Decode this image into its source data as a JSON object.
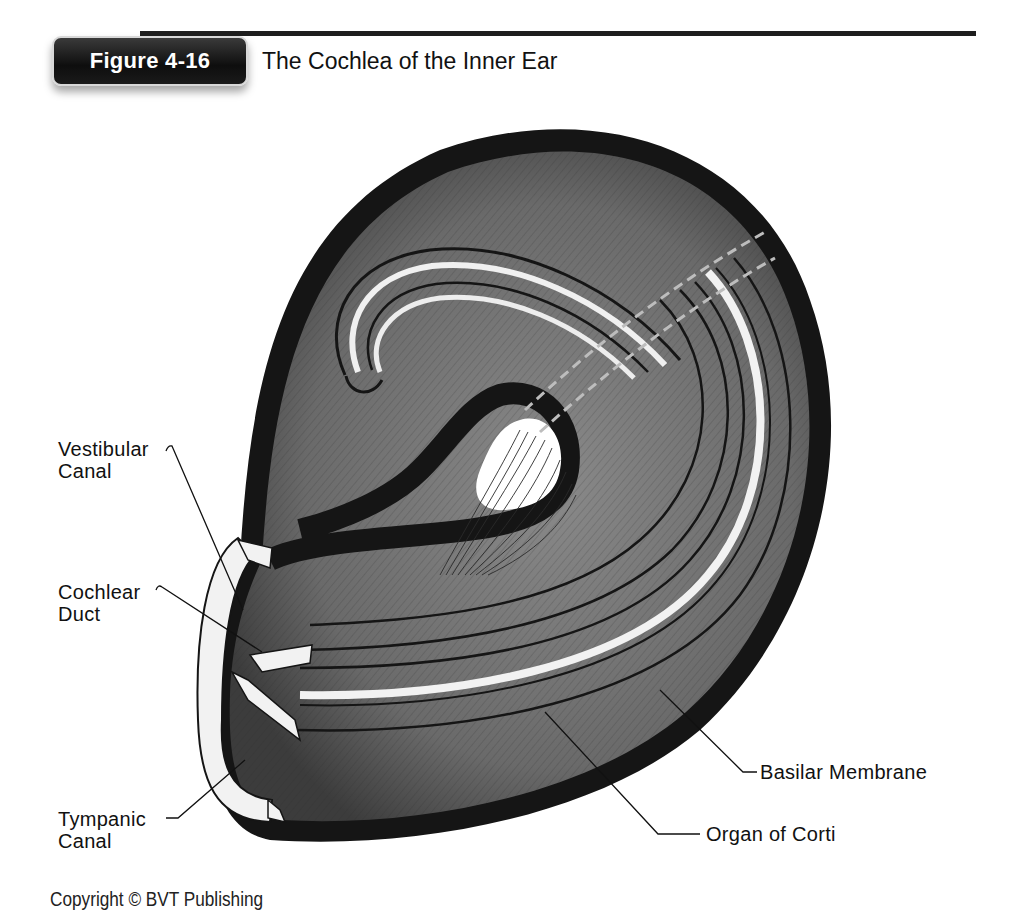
{
  "header": {
    "badge_label": "Figure 4-16",
    "title": "The Cochlea of the Inner Ear"
  },
  "figure": {
    "colors": {
      "outer_wall": "#151515",
      "canal_fill": "#6e6e6e",
      "highlight": "#f2f2f2",
      "dashed_line": "#bdbdbd"
    },
    "labels": [
      {
        "id": "vestibular-canal",
        "lines": [
          "Vestibular",
          "Canal"
        ]
      },
      {
        "id": "cochlear-duct",
        "lines": [
          "Cochlear",
          "Duct"
        ]
      },
      {
        "id": "tympanic-canal",
        "lines": [
          "Tympanic",
          "Canal"
        ]
      },
      {
        "id": "basilar-membrane",
        "lines": [
          "Basilar Membrane"
        ]
      },
      {
        "id": "organ-of-corti",
        "lines": [
          "Organ of Corti"
        ]
      }
    ]
  },
  "footer": {
    "copyright": "Copyright © BVT Publishing"
  }
}
